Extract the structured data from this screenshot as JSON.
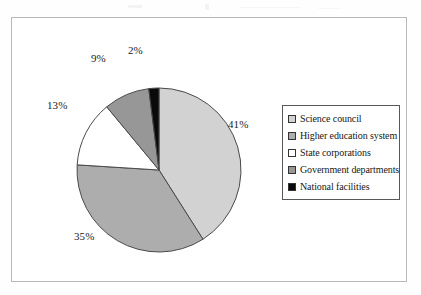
{
  "chart_data": {
    "type": "pie",
    "title": "",
    "xlabel": "",
    "ylabel": "",
    "categories": [
      "Science council",
      "Higher education system",
      "State corporations",
      "Government departments",
      "National facilities"
    ],
    "values": [
      41,
      35,
      13,
      9,
      2
    ],
    "value_labels": [
      "41%",
      "35%",
      "13%",
      "9%",
      "2%"
    ],
    "units": "percent",
    "slice_colors": [
      "#d2d2d2",
      "#adadad",
      "#ffffff",
      "#979797",
      "#0a0a0a"
    ],
    "slice_order": "clockwise from 12 o'clock",
    "start_angle_deg": 0,
    "legend_position": "right",
    "grid": false,
    "border_color": "#4a4a4a",
    "frame_color": "#b9b9b9"
  },
  "legend": {
    "entries": [
      {
        "label": "Science council",
        "swatch": "#d2d2d2"
      },
      {
        "label": "Higher education system",
        "swatch": "#adadad"
      },
      {
        "label": "State corporations",
        "swatch": "#ffffff"
      },
      {
        "label": "Government departments",
        "swatch": "#979797"
      },
      {
        "label": "National facilities",
        "swatch": "#0a0a0a"
      }
    ]
  }
}
